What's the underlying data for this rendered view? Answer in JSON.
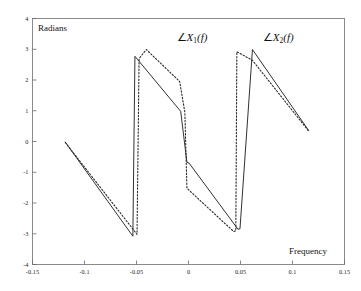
{
  "chart_data": {
    "type": "line",
    "title": "",
    "xlabel": "Frequency",
    "ylabel": "Radians",
    "xlim": [
      -0.15,
      0.15
    ],
    "ylim": [
      -4,
      4
    ],
    "xticks": [
      "-0.15",
      "-0.1",
      "-0.05",
      "0",
      "0.05",
      "0.1",
      "0.15"
    ],
    "xtick_values": [
      -0.15,
      -0.1,
      -0.05,
      0,
      0.05,
      0.1,
      0.15
    ],
    "yticks": [
      "4",
      "3",
      "2",
      "1",
      "0",
      "-1",
      "-2",
      "-3",
      "-4"
    ],
    "ytick_values": [
      4,
      3,
      2,
      1,
      0,
      -1,
      -2,
      -3,
      -4
    ],
    "grid": false,
    "legend_position": "inline-annotations",
    "series": [
      {
        "name": "∠X1(f)",
        "style": "solid",
        "color": "#1a1a1a",
        "points": [
          [
            -0.1185,
            -0.02
          ],
          [
            -0.0535,
            -3.08
          ],
          [
            -0.0515,
            2.77
          ],
          [
            -0.0075,
            0.98
          ],
          [
            -0.0015,
            -0.68
          ],
          [
            0.0005,
            -0.7
          ],
          [
            0.0475,
            -2.85
          ],
          [
            0.0495,
            -2.84
          ],
          [
            0.0615,
            2.99
          ],
          [
            0.1155,
            0.36
          ]
        ]
      },
      {
        "name": "∠X2(f)",
        "style": "dotted",
        "color": "#2a2a2a",
        "points": [
          [
            -0.1185,
            -0.03
          ],
          [
            -0.0495,
            -3.02
          ],
          [
            -0.0475,
            2.7
          ],
          [
            -0.0405,
            2.99
          ],
          [
            -0.0085,
            1.95
          ],
          [
            -0.0035,
            0.95
          ],
          [
            -0.0015,
            -1.52
          ],
          [
            0.0435,
            -2.93
          ],
          [
            0.0455,
            -2.9
          ],
          [
            0.0465,
            2.92
          ],
          [
            0.0615,
            2.64
          ],
          [
            0.1155,
            0.34
          ]
        ]
      }
    ],
    "annotations": [
      {
        "text": "∠X1(f)",
        "x": -0.0115,
        "y": 3.32
      },
      {
        "text": "∠X2(f)",
        "x": 0.0715,
        "y": 3.34
      }
    ]
  },
  "axes": {
    "ylabel": "Radians",
    "xlabel": "Frequency"
  },
  "labels": {
    "series1_angle": "∠",
    "series1_var": "X",
    "series1_sub": "1",
    "series1_arg": "(f)",
    "series2_angle": "∠",
    "series2_var": "X",
    "series2_sub": "2",
    "series2_arg": "(f)"
  },
  "style": {
    "frame_color": "#6b6b6b",
    "curve_color": "#1a1a1a",
    "background": "#ffffff"
  }
}
